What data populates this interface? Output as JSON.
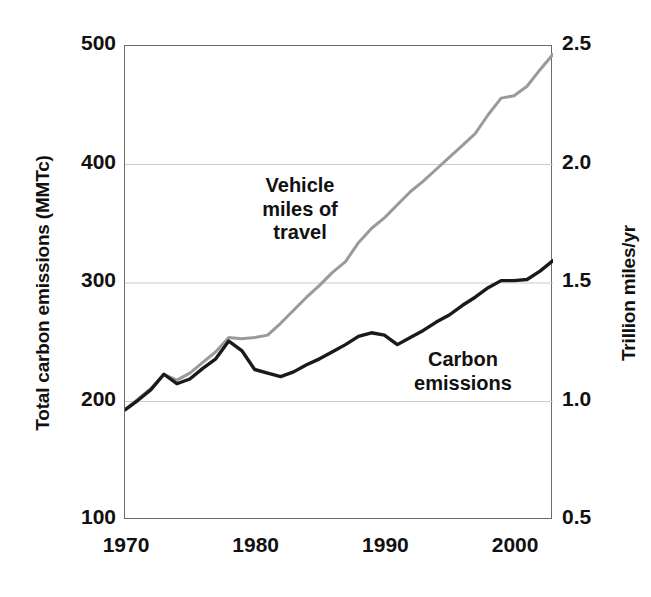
{
  "chart_data": {
    "type": "line",
    "title": "",
    "subtitle": "",
    "xlabel": "",
    "ylabel": "Total carbon emissions (MMTc)",
    "y2label": "Trillion miles/yr",
    "xlim": [
      1970,
      2003
    ],
    "ylim": [
      100,
      500
    ],
    "y2lim": [
      0.5,
      2.5
    ],
    "grid": true,
    "grid_axis": "y",
    "legend_position": "inline-annotations",
    "x_ticks": [
      1970,
      1980,
      1990,
      2000
    ],
    "x_tick_labels": [
      "1970",
      "1980",
      "1990",
      "2000"
    ],
    "y_ticks": [
      100,
      200,
      300,
      400,
      500
    ],
    "y_tick_labels": [
      "100",
      "200",
      "300",
      "400",
      "500"
    ],
    "y2_ticks": [
      0.5,
      1.0,
      1.5,
      2.0,
      2.5
    ],
    "y2_tick_labels": [
      "0.5",
      "1.0",
      "1.5",
      "2.0",
      "2.5"
    ],
    "x": [
      1970,
      1971,
      1972,
      1973,
      1974,
      1975,
      1976,
      1977,
      1978,
      1979,
      1980,
      1981,
      1982,
      1983,
      1984,
      1985,
      1986,
      1987,
      1988,
      1989,
      1990,
      1991,
      1992,
      1993,
      1994,
      1995,
      1996,
      1997,
      1998,
      1999,
      2000,
      2001,
      2002,
      2003
    ],
    "series": [
      {
        "name": "Carbon emissions",
        "axis": "left",
        "color": "#1a1a1a",
        "unit": "MMTc",
        "values": [
          193,
          201,
          210,
          223,
          215,
          219,
          228,
          236,
          251,
          243,
          227,
          224,
          221,
          225,
          231,
          236,
          242,
          248,
          255,
          258,
          256,
          248,
          254,
          260,
          267,
          273,
          281,
          288,
          296,
          302,
          302,
          303,
          310,
          319
        ]
      },
      {
        "name": "Vehicle miles of travel",
        "axis": "right",
        "color": "#9a9a9a",
        "unit": "Trillion miles/yr",
        "values": [
          0.965,
          1.01,
          1.055,
          1.115,
          1.09,
          1.12,
          1.165,
          1.21,
          1.27,
          1.265,
          1.27,
          1.28,
          1.33,
          1.385,
          1.44,
          1.49,
          1.545,
          1.59,
          1.67,
          1.73,
          1.775,
          1.83,
          1.885,
          1.93,
          1.98,
          2.03,
          2.08,
          2.13,
          2.21,
          2.28,
          2.29,
          2.33,
          2.4,
          2.465
        ]
      }
    ],
    "annotations": [
      {
        "name": "vmt-label",
        "text": "Vehicle\nmiles of\ntravel",
        "series": "Vehicle miles of travel"
      },
      {
        "name": "carbon-label",
        "text": "Carbon\nemissions",
        "series": "Carbon emissions"
      }
    ]
  },
  "axes": {
    "left": {
      "title": "Total carbon emissions (MMTc)",
      "ticks": [
        "500",
        "400",
        "300",
        "200",
        "100"
      ]
    },
    "right": {
      "title": "Trillion miles/yr",
      "ticks": [
        "2.5",
        "2.0",
        "1.5",
        "1.0",
        "0.5"
      ]
    },
    "bottom": {
      "title": "",
      "ticks": [
        "1970",
        "1980",
        "1990",
        "2000"
      ]
    }
  },
  "annotations": {
    "vmt": "Vehicle\nmiles of\ntravel",
    "carbon": "Carbon\nemissions"
  },
  "colors": {
    "carbon_line": "#1a1a1a",
    "vmt_line": "#9a9a9a",
    "gridline": "#cccccc",
    "frame": "#6b6b6b",
    "background": "#ffffff",
    "text": "#111111"
  }
}
